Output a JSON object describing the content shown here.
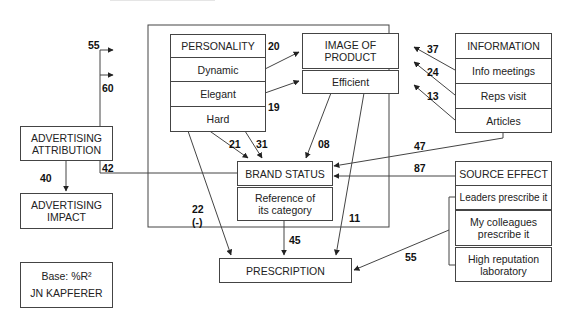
{
  "diagram": {
    "title_partial": "... typical prescription process (partially cut off at top)",
    "personality": {
      "header": "PERSONALITY",
      "items": [
        "Dynamic",
        "Elegant",
        "Hard"
      ]
    },
    "image_of_product": {
      "header_line1": "IMAGE OF",
      "header_line2": "PRODUCT",
      "items": [
        "Efficient"
      ]
    },
    "information": {
      "header": "INFORMATION",
      "items": [
        "Info meetings",
        "Reps visit",
        "Articles"
      ]
    },
    "brand_status": {
      "header": "BRAND STATUS",
      "sub_line1": "Reference of",
      "sub_line2": "its category"
    },
    "prescription": {
      "label": "PRESCRIPTION"
    },
    "source_effect": {
      "header": "SOURCE EFFECT",
      "items": [
        {
          "line1": "Leaders prescribe it",
          "line2": ""
        },
        {
          "line1": "My colleagues",
          "line2": "prescribe it"
        },
        {
          "line1": "High reputation",
          "line2": "laboratory"
        }
      ]
    },
    "legend": {
      "attribution_line1": "ADVERTISING",
      "attribution_line2": "ATTRIBUTION",
      "impact_line1": "ADVERTISING",
      "impact_line2": "IMPACT",
      "example_weight": "40",
      "base": "Base: %R²",
      "author": "JN KAPFERER"
    },
    "weights": {
      "personality_r2": "20",
      "elegant_hard_r2": "19",
      "loop_to_dynamic": "55",
      "loop_to_elegant": "60",
      "brand_status_out": "42",
      "elegant_to_brand": "21",
      "hard_to_brand": "31",
      "efficient_to_brand": "08",
      "info_meetings_to_image": "37",
      "reps_visit_to_image": "24",
      "articles_to_image": "13",
      "articles_to_brand": "47",
      "source_to_brand": "87",
      "hard_to_prescription": "22",
      "hard_to_prescription_sign": "(-)",
      "reference_to_prescription": "45",
      "efficient_to_prescription": "11",
      "source_to_prescription": "55"
    },
    "colors": {
      "line": "#444444",
      "text": "#111111",
      "background": "#ffffff"
    }
  }
}
